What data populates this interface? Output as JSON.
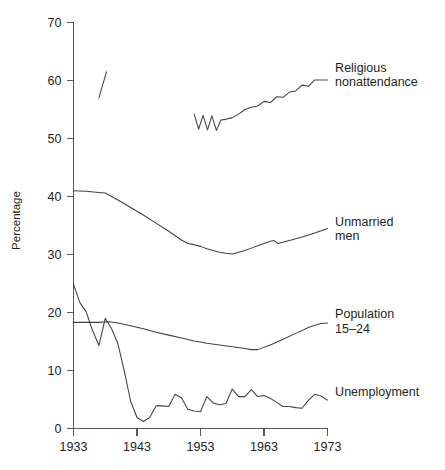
{
  "chart_data": {
    "type": "line",
    "title": "",
    "xlabel": "",
    "ylabel": "Percentage",
    "xlim": [
      1933,
      1974
    ],
    "ylim": [
      0,
      70
    ],
    "grid": false,
    "legend_position": "right-inline-labels",
    "x_ticks": [
      "1933",
      "1943",
      "1953",
      "1963",
      "1973"
    ],
    "x_tick_values": [
      1933,
      1943,
      1953,
      1963,
      1973
    ],
    "y_ticks": [
      "0",
      "10",
      "20",
      "30",
      "40",
      "50",
      "60",
      "70"
    ],
    "y_tick_values": [
      0,
      10,
      20,
      30,
      40,
      50,
      60,
      70
    ],
    "series": [
      {
        "name": "Religious nonattendance",
        "label_lines": [
          "Religious",
          "nonattendance"
        ],
        "label_x": 1974.2,
        "label_y": 61.5,
        "segments": [
          {
            "x": [
              1937.0,
              1938.2
            ],
            "values": [
              57.0,
              61.5
            ]
          },
          {
            "x": [
              1952.0,
              1952.7,
              1953.4,
              1954.1,
              1954.8,
              1955.5,
              1956.2,
              1957.0,
              1958.0,
              1959.0,
              1960.0,
              1961.0,
              1962.0,
              1963.0,
              1964.0,
              1965.0,
              1966.0,
              1967.0,
              1968.0,
              1969.0,
              1970.0,
              1971.0,
              1972.0,
              1973.0
            ],
            "values": [
              54.2,
              51.6,
              54.0,
              51.5,
              53.9,
              51.4,
              53.2,
              53.3,
              53.6,
              54.2,
              55.0,
              55.4,
              55.6,
              56.4,
              56.2,
              57.2,
              57.1,
              58.0,
              58.2,
              59.2,
              59.0,
              60.1,
              60.1,
              60.1
            ]
          }
        ]
      },
      {
        "name": "Unmarried men",
        "label_lines": [
          "Unmarried",
          "men"
        ],
        "label_x": 1974.2,
        "label_y": 35.0,
        "segments": [
          {
            "x": [
              1933,
              1935,
              1937,
              1938,
              1940,
              1942,
              1944,
              1946,
              1948,
              1950,
              1951,
              1952,
              1953,
              1954,
              1955,
              1956,
              1957,
              1958,
              1959,
              1960,
              1961,
              1962,
              1963,
              1964,
              1964.6,
              1965.2,
              1967,
              1969,
              1971,
              1973
            ],
            "values": [
              41.0,
              40.9,
              40.7,
              40.6,
              39.4,
              38.1,
              36.8,
              35.4,
              34.0,
              32.5,
              31.9,
              31.7,
              31.4,
              31.0,
              30.7,
              30.4,
              30.2,
              30.1,
              30.4,
              30.7,
              31.1,
              31.5,
              31.9,
              32.3,
              32.4,
              31.9,
              32.4,
              33.0,
              33.7,
              34.5
            ]
          }
        ]
      },
      {
        "name": "Population 15–24",
        "label_lines": [
          "Population",
          "15–24"
        ],
        "label_x": 1974.2,
        "label_y": 19.0,
        "segments": [
          {
            "x": [
              1933,
              1935,
              1937,
              1938.6,
              1940,
              1942,
              1944,
              1946,
              1948,
              1950,
              1952,
              1953,
              1954,
              1956,
              1958,
              1960,
              1961,
              1962,
              1964,
              1966,
              1968,
              1970,
              1971,
              1972,
              1973
            ],
            "values": [
              18.3,
              18.3,
              18.3,
              18.4,
              18.2,
              17.7,
              17.2,
              16.6,
              16.1,
              15.6,
              15.1,
              14.9,
              14.7,
              14.4,
              14.1,
              13.8,
              13.6,
              13.6,
              14.4,
              15.4,
              16.4,
              17.4,
              17.8,
              18.1,
              18.2
            ]
          }
        ]
      },
      {
        "name": "Unemployment",
        "label_lines": [
          "Unemployment"
        ],
        "label_x": 1974.2,
        "label_y": 5.6,
        "segments": [
          {
            "x": [
              1933,
              1934,
              1935,
              1936,
              1937,
              1938,
              1939,
              1940,
              1941,
              1942,
              1943,
              1944,
              1945,
              1946,
              1947,
              1948,
              1949,
              1950,
              1951,
              1952,
              1953,
              1954,
              1955,
              1956,
              1957,
              1958,
              1959,
              1960,
              1961,
              1962,
              1963,
              1964,
              1965,
              1966,
              1967,
              1968,
              1969,
              1970,
              1971,
              1972,
              1973
            ],
            "values": [
              24.9,
              21.7,
              20.1,
              16.9,
              14.3,
              19.0,
              17.2,
              14.6,
              9.9,
              4.7,
              1.9,
              1.2,
              1.9,
              3.9,
              3.9,
              3.8,
              5.9,
              5.3,
              3.3,
              3.0,
              2.9,
              5.5,
              4.4,
              4.1,
              4.3,
              6.8,
              5.5,
              5.5,
              6.7,
              5.5,
              5.7,
              5.2,
              4.5,
              3.8,
              3.8,
              3.6,
              3.5,
              4.9,
              5.9,
              5.6,
              4.9
            ]
          }
        ]
      }
    ]
  }
}
